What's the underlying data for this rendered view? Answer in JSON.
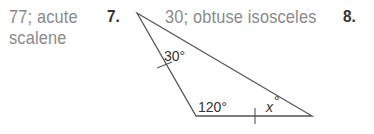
{
  "answers": {
    "prev": {
      "line1": "77; acute",
      "line2": "scalene"
    },
    "item7": {
      "number": "7.",
      "answer": "30; obtuse isosceles"
    },
    "item8": {
      "number": "8."
    }
  },
  "figure": {
    "angle_top": "30°",
    "angle_bottom_left": "120°",
    "angle_bottom_right_var": "x",
    "angle_bottom_right_deg": "°"
  }
}
